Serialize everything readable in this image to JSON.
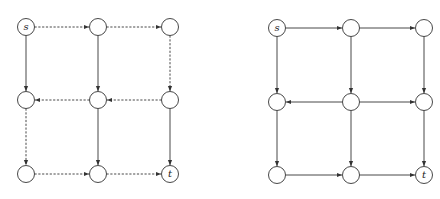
{
  "colors": {
    "stroke": "#333333",
    "node_fill": "#ffffff",
    "background": "#ffffff"
  },
  "node_radius": 8.5,
  "graphs": [
    {
      "name": "left-graph",
      "columns_x": [
        26,
        98,
        170
      ],
      "rows_y": [
        27,
        100,
        174
      ],
      "labels": {
        "0,0": "s",
        "2,2": "t"
      },
      "edges": [
        {
          "from": [
            0,
            0
          ],
          "to": [
            1,
            0
          ],
          "style": "dashed"
        },
        {
          "from": [
            1,
            0
          ],
          "to": [
            2,
            0
          ],
          "style": "dashed"
        },
        {
          "from": [
            1,
            1
          ],
          "to": [
            0,
            1
          ],
          "style": "dashed"
        },
        {
          "from": [
            2,
            1
          ],
          "to": [
            1,
            1
          ],
          "style": "dashed"
        },
        {
          "from": [
            0,
            2
          ],
          "to": [
            1,
            2
          ],
          "style": "dashed"
        },
        {
          "from": [
            1,
            2
          ],
          "to": [
            2,
            2
          ],
          "style": "dashed"
        },
        {
          "from": [
            0,
            0
          ],
          "to": [
            0,
            1
          ],
          "style": "solid"
        },
        {
          "from": [
            0,
            1
          ],
          "to": [
            0,
            2
          ],
          "style": "dashed"
        },
        {
          "from": [
            1,
            0
          ],
          "to": [
            1,
            1
          ],
          "style": "solid"
        },
        {
          "from": [
            1,
            1
          ],
          "to": [
            1,
            2
          ],
          "style": "solid"
        },
        {
          "from": [
            2,
            0
          ],
          "to": [
            2,
            1
          ],
          "style": "dashed"
        },
        {
          "from": [
            2,
            1
          ],
          "to": [
            2,
            2
          ],
          "style": "solid"
        }
      ]
    },
    {
      "name": "right-graph",
      "columns_x": [
        277,
        351,
        424
      ],
      "rows_y": [
        28,
        102,
        175
      ],
      "labels": {
        "0,0": "s",
        "2,2": "t"
      },
      "edges": [
        {
          "from": [
            0,
            0
          ],
          "to": [
            1,
            0
          ],
          "style": "solid"
        },
        {
          "from": [
            1,
            0
          ],
          "to": [
            2,
            0
          ],
          "style": "solid"
        },
        {
          "from": [
            1,
            1
          ],
          "to": [
            0,
            1
          ],
          "style": "solid"
        },
        {
          "from": [
            1,
            1
          ],
          "to": [
            2,
            1
          ],
          "style": "solid"
        },
        {
          "from": [
            0,
            2
          ],
          "to": [
            1,
            2
          ],
          "style": "solid"
        },
        {
          "from": [
            1,
            2
          ],
          "to": [
            2,
            2
          ],
          "style": "solid"
        },
        {
          "from": [
            0,
            0
          ],
          "to": [
            0,
            1
          ],
          "style": "solid"
        },
        {
          "from": [
            0,
            1
          ],
          "to": [
            0,
            2
          ],
          "style": "solid"
        },
        {
          "from": [
            1,
            0
          ],
          "to": [
            1,
            1
          ],
          "style": "solid"
        },
        {
          "from": [
            1,
            1
          ],
          "to": [
            1,
            2
          ],
          "style": "solid"
        },
        {
          "from": [
            2,
            0
          ],
          "to": [
            2,
            1
          ],
          "style": "solid"
        },
        {
          "from": [
            2,
            1
          ],
          "to": [
            2,
            2
          ],
          "style": "solid"
        }
      ]
    }
  ]
}
